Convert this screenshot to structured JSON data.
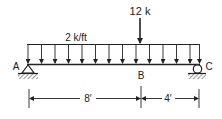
{
  "diagram": {
    "type": "simply-supported-beam",
    "distributed_load": {
      "label": "2 k/ft",
      "arrow_count": 14
    },
    "point_load": {
      "label": "12 k",
      "location": "B"
    },
    "supports": [
      {
        "label": "A",
        "type": "pin"
      },
      {
        "label": "C",
        "type": "roller"
      }
    ],
    "points": {
      "a": "A",
      "b": "B",
      "c": "C"
    },
    "dimensions": [
      {
        "label": "8′",
        "from": "A",
        "to": "B"
      },
      {
        "label": "4′",
        "from": "B",
        "to": "C"
      }
    ],
    "colors": {
      "ink": "#222222",
      "background": "#ffffff"
    }
  }
}
